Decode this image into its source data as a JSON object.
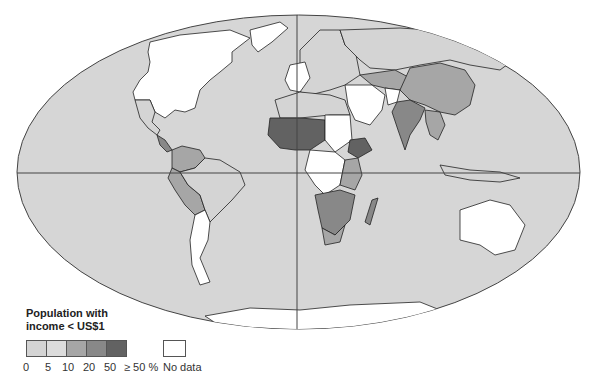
{
  "legend": {
    "title_line1": "Population with",
    "title_line2": "income < US$1",
    "ticks": [
      "0",
      "5",
      "10",
      "20",
      "50",
      "≥ 50 %"
    ],
    "no_data_label": "No data",
    "bins": [
      {
        "range": "0-5",
        "color": "#d4d4d4"
      },
      {
        "range": "5-10",
        "color": "#dcdcdc"
      },
      {
        "range": "10-20",
        "color": "#a6a6a6"
      },
      {
        "range": "20-50",
        "color": "#888888"
      },
      {
        "range": ">=50",
        "color": "#626262"
      }
    ],
    "no_data_color": "#ffffff"
  },
  "map": {
    "ocean_color": "#d6d6d6",
    "projection": "Mollweide-like world ellipse",
    "graticule": [
      "equator",
      "prime-meridian"
    ]
  }
}
